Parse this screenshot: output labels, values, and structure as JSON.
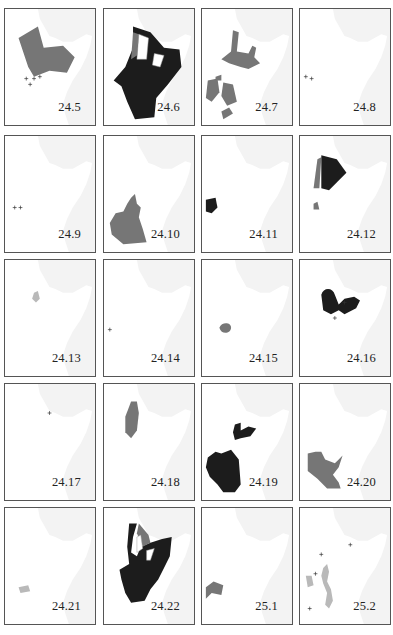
{
  "figure": {
    "colors": {
      "black": "#1c1c1c",
      "gray": "#767676",
      "light": "#b9b9b9",
      "sea": "#f3f3f3",
      "border": "#9a9a9a"
    },
    "panels": [
      {
        "label": "24.5",
        "fill": [
          [
            "gray",
            "M14,30 L34,18 L40,40 L60,38 L72,50 L64,66 L46,64 L30,70 L24,60 Z"
          ]
        ],
        "marks": [
          [
            22,
            72
          ],
          [
            30,
            72
          ],
          [
            36,
            70
          ],
          [
            26,
            78
          ]
        ]
      },
      {
        "label": "24.6",
        "fill": [
          [
            "black",
            "M30,18 L48,24 L62,40 L78,42 L80,60 L66,78 L54,92 L52,112 L32,114 L24,96 L18,80 L10,74 L22,60 L30,40 Z"
          ],
          [
            "gray",
            "M30,24 L36,26 L34,48 L28,52 Z"
          ]
        ],
        "holes": [
          "M36,26 L46,30 L44,52 L34,52 Z",
          "M52,46 L62,48 L58,60 L50,58 Z"
        ]
      },
      {
        "label": "24.7",
        "fill": [
          [
            "gray",
            "M32,22 L38,24 L36,44 L48,46 L52,38 L56,40 L54,50 L60,56 L48,62 L40,60 L28,56 L20,52 L30,44 Z"
          ],
          [
            "gray",
            "M6,74 L16,72 L18,86 L10,96 L4,92 Z"
          ],
          [
            "gray",
            "M22,76 L32,78 L36,96 L26,100 L20,90 Z"
          ],
          [
            "gray",
            "M20,106 L28,102 L32,108 L22,114 Z"
          ],
          [
            "gray",
            "M14,70 L20,68 L20,74 L14,74 Z"
          ]
        ]
      },
      {
        "label": "24.8",
        "fill": [],
        "marks": [
          [
            6,
            70
          ],
          [
            12,
            72
          ]
        ]
      },
      {
        "label": "24.9",
        "fill": [],
        "marks": [
          [
            10,
            74
          ],
          [
            16,
            74
          ]
        ]
      },
      {
        "label": "24.10",
        "fill": [
          [
            "gray",
            "M28,64 L32,60 L34,70 L38,74 L36,84 L40,96 L44,110 L20,112 L8,102 L6,90 L12,80 L20,78 L24,70 Z"
          ]
        ]
      },
      {
        "label": "24.11",
        "fill": [
          [
            "black",
            "M4,66 L14,64 L16,74 L10,80 L4,78 Z"
          ]
        ]
      },
      {
        "label": "24.12",
        "fill": [
          [
            "gray",
            "M18,24 L22,22 L20,54 L14,54 Z"
          ],
          [
            "black",
            "M22,20 L38,24 L48,38 L40,46 L30,56 L22,54 Z"
          ],
          [
            "gray",
            "M14,70 L18,68 L20,76 L14,76 Z"
          ]
        ]
      },
      {
        "label": "24.13",
        "fill": [
          [
            "light",
            "M30,34 L34,32 L36,40 L32,44 L28,40 Z"
          ]
        ]
      },
      {
        "label": "24.14",
        "fill": [],
        "marks": [
          [
            6,
            72
          ]
        ]
      },
      {
        "label": "24.15",
        "fill": [
          [
            "gray",
            "M18,70 C20,64 30,64 30,70 C30,76 20,78 18,70 Z"
          ]
        ]
      },
      {
        "label": "24.16",
        "fill": [
          [
            "black",
            "M22,36 C24,28 34,28 36,36 L40,46 L46,40 L56,38 L62,42 L58,50 L46,56 L40,52 L32,56 L24,52 Z"
          ]
        ],
        "marks": [
          [
            46,
            44
          ],
          [
            36,
            60
          ]
        ]
      },
      {
        "label": "24.17",
        "fill": [],
        "marks": [
          [
            46,
            30
          ]
        ]
      },
      {
        "label": "24.18",
        "fill": [
          [
            "gray",
            "M28,18 L34,18 L36,30 L34,48 L28,56 L22,50 L22,34 Z"
          ]
        ]
      },
      {
        "label": "24.19",
        "fill": [
          [
            "black",
            "M34,42 L40,40 L40,48 L48,44 L56,46 L50,54 L40,56 L34,58 L32,50 Z"
          ],
          [
            "black",
            "M6,76 L14,70 L20,72 L30,68 L38,78 L40,104 L34,112 L22,112 L16,104 L8,96 L4,86 Z"
          ]
        ]
      },
      {
        "label": "24.20",
        "fill": [
          [
            "gray",
            "M8,72 L16,70 L22,70 L26,78 L36,82 L40,78 L44,74 L40,86 L34,94 L40,102 L42,108 L28,108 L18,98 L8,90 Z"
          ]
        ]
      },
      {
        "label": "24.21",
        "fill": [
          [
            "light",
            "M14,82 L24,80 L26,86 L16,88 Z"
          ]
        ]
      },
      {
        "label": "24.22",
        "fill": [
          [
            "black",
            "M26,16 L34,16 L30,30 L28,46 L34,50 L38,40 L48,36 L60,32 L70,30 L68,50 L62,62 L56,74 L48,84 L42,96 L28,98 L22,88 L18,74 L16,64 L26,58 L24,40 Z"
          ],
          [
            "gray",
            "M36,16 L46,28 L48,36 L40,40 L34,26 Z"
          ]
        ],
        "holes": [
          "M34,30 L38,28 L40,42 L34,46 Z",
          "M44,44 L52,42 L48,54 L44,54 Z"
        ]
      },
      {
        "label": "25.1",
        "fill": [
          [
            "gray",
            "M4,82 L12,76 L22,80 L20,90 L10,88 L4,94 Z"
          ]
        ]
      },
      {
        "label": "25.2",
        "fill": [
          [
            "light",
            "M24,62 L28,58 L30,66 L28,76 L32,84 L34,96 L30,104 L26,100 L28,88 L24,78 L22,70 Z"
          ],
          [
            "light",
            "M6,70 L12,70 L14,80 L8,82 Z"
          ]
        ],
        "marks": [
          [
            52,
            38
          ],
          [
            22,
            48
          ],
          [
            16,
            68
          ],
          [
            10,
            104
          ]
        ]
      }
    ]
  }
}
